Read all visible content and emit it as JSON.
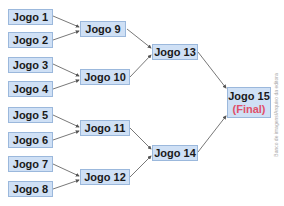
{
  "diagram": {
    "type": "tournament-bracket",
    "colors": {
      "box_fill": "#cfe0f5",
      "box_border": "#9bb8dc",
      "final_label": "#e0506a",
      "connector": "#555555"
    },
    "round1": [
      {
        "label": "Jogo 1"
      },
      {
        "label": "Jogo 2"
      },
      {
        "label": "Jogo 3"
      },
      {
        "label": "Jogo 4"
      },
      {
        "label": "Jogo 5"
      },
      {
        "label": "Jogo 6"
      },
      {
        "label": "Jogo 7"
      },
      {
        "label": "Jogo 8"
      }
    ],
    "round2": [
      {
        "label": "Jogo 9"
      },
      {
        "label": "Jogo 10"
      },
      {
        "label": "Jogo 11"
      },
      {
        "label": "Jogo 12"
      }
    ],
    "round3": [
      {
        "label": "Jogo 13"
      },
      {
        "label": "Jogo 14"
      }
    ],
    "final": {
      "label": "Jogo 15",
      "sublabel": "(Final)"
    },
    "credit": "Banco de imagens/Arquivo da editora"
  }
}
